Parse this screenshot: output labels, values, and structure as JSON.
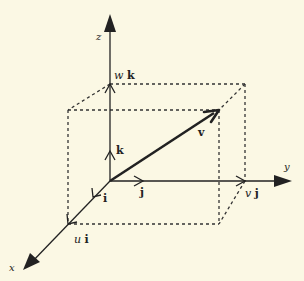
{
  "diagram": {
    "axes": {
      "x": {
        "label": "x"
      },
      "y": {
        "label": "y"
      },
      "z": {
        "label": "z"
      }
    },
    "unit_vectors": {
      "i": "i",
      "j": "j",
      "k": "k"
    },
    "vector": {
      "label": "v"
    },
    "components": {
      "u_scalar": "u",
      "v_scalar": "v",
      "w_scalar": "w",
      "ui_unit": "i",
      "vj_unit": "j",
      "wk_unit": "k"
    },
    "colors": {
      "background": "#fbf8e4",
      "ink": "#222222"
    }
  }
}
